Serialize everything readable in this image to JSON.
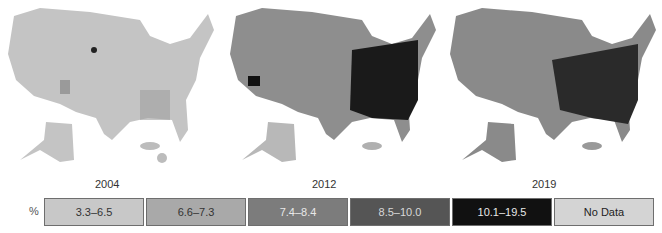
{
  "figure": {
    "maps": [
      {
        "year": "2004",
        "fill": "#c4c4c4",
        "dark_spots": "#8a8a8a"
      },
      {
        "year": "2012",
        "fill": "#8e8e8e",
        "dark_spots": "#1a1a1a"
      },
      {
        "year": "2019",
        "fill": "#8a8a8a",
        "dark_spots": "#1a1a1a"
      }
    ],
    "legend": {
      "unit": "%",
      "items": [
        {
          "label": "3.3–6.5",
          "color": "#c8c8c8",
          "text_color": "#333333"
        },
        {
          "label": "6.6–7.3",
          "color": "#a9a9a9",
          "text_color": "#333333"
        },
        {
          "label": "7.4–8.4",
          "color": "#7c7c7c",
          "text_color": "#e8e8e8"
        },
        {
          "label": "8.5–10.0",
          "color": "#555555",
          "text_color": "#d8d8d8"
        },
        {
          "label": "10.1–19.5",
          "color": "#111111",
          "text_color": "#e8e8e8"
        },
        {
          "label": "No Data",
          "color": "#d4d4d4",
          "text_color": "#222222"
        }
      ]
    }
  }
}
